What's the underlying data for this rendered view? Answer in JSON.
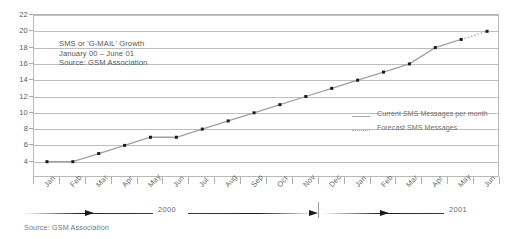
{
  "chart_data": {
    "type": "line",
    "title": "SMS or 'G-MAIL' Growth",
    "subtitle": "January 00 – June 01",
    "source_note": "Source: GSM Association",
    "xlabel": "",
    "ylabel": "",
    "ylim": [
      2,
      22
    ],
    "yticks": [
      4,
      6,
      8,
      10,
      12,
      14,
      16,
      18,
      20,
      22
    ],
    "grid": true,
    "legend_position": "inside-right",
    "categories": [
      "Jan",
      "Feb",
      "Mar",
      "Apr",
      "May",
      "Jun",
      "Jul",
      "Aug",
      "Sep",
      "Oct",
      "Nov",
      "Dec",
      "Jan",
      "Feb",
      "Mar",
      "Apr",
      "May",
      "Jun"
    ],
    "values": [
      4,
      4,
      5,
      6,
      7,
      7,
      8,
      9,
      10,
      11,
      12,
      13,
      14,
      15,
      16,
      18,
      19,
      20
    ],
    "forecast_start_index": 16,
    "series": [
      {
        "name": "Current SMS Messages per month",
        "style": "solid"
      },
      {
        "name": "Forecast SMS Messages",
        "style": "dotted"
      }
    ],
    "year_groups": [
      {
        "label": "2000",
        "start_index": 0,
        "end_index": 11
      },
      {
        "label": "2001",
        "start_index": 12,
        "end_index": 17
      }
    ],
    "colors": {
      "line": "#a0a0a0",
      "marker": "#1a1a1a",
      "grid": "#bdbdbd",
      "axis": "#b9b9b9",
      "text": "#5a5a5a"
    }
  },
  "annotation": {
    "line1": "SMS or 'G-MAIL' Growth",
    "line2": "January 00 – June 01",
    "line3": "Source: GSM Association"
  },
  "legend": {
    "items": [
      {
        "label": "Current SMS Messages per month"
      },
      {
        "label": "Forecast SMS Messages"
      }
    ]
  },
  "footer": {
    "source": "Source: GSM Association"
  },
  "year_axis": {
    "left_label": "2000",
    "right_label": "2001"
  }
}
